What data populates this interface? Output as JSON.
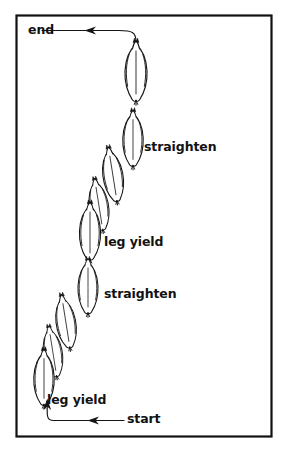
{
  "diagram": {
    "type": "arena-schooling-figure",
    "frame": {
      "border_color": "#111111",
      "background_color": "#ffffff",
      "x": 16,
      "y": 15,
      "width": 256,
      "height": 422
    },
    "labels": {
      "end": "end",
      "start": "start",
      "straighten_upper": "straighten",
      "leg_yield_upper": "leg yield",
      "straighten_lower": "straighten",
      "leg_yield_lower": "leg yield"
    },
    "label_positions": [
      {
        "name": "end-label",
        "text": "end",
        "x": 28,
        "y": 24
      },
      {
        "name": "straighten-upper-label",
        "text": "straighten",
        "x": 144,
        "y": 141
      },
      {
        "name": "leg-yield-upper-label",
        "text": "leg yield",
        "x": 104,
        "y": 236
      },
      {
        "name": "straighten-lower-label",
        "text": "straighten",
        "x": 104,
        "y": 288
      },
      {
        "name": "leg-yield-lower-label",
        "text": "leg yield",
        "x": 47,
        "y": 394
      },
      {
        "name": "start-label",
        "text": "start",
        "x": 127,
        "y": 417
      }
    ],
    "horses": [
      {
        "index": 1,
        "cx": 136,
        "cy": 73,
        "w": 24,
        "h": 56,
        "tilt": 0
      },
      {
        "index": 2,
        "cx": 133,
        "cy": 140,
        "w": 22,
        "h": 52,
        "tilt": 0
      },
      {
        "index": 3,
        "cx": 113,
        "cy": 175,
        "w": 22,
        "h": 52,
        "tilt": -8
      },
      {
        "index": 4,
        "cx": 100,
        "cy": 205,
        "w": 20,
        "h": 48,
        "tilt": -8
      },
      {
        "index": 5,
        "cx": 90,
        "cy": 232,
        "w": 22,
        "h": 54,
        "tilt": 0
      },
      {
        "index": 6,
        "cx": 88,
        "cy": 287,
        "w": 22,
        "h": 52,
        "tilt": 0
      },
      {
        "index": 7,
        "cx": 66,
        "cy": 322,
        "w": 21,
        "h": 50,
        "tilt": -8
      },
      {
        "index": 8,
        "cx": 54,
        "cy": 352,
        "w": 20,
        "h": 48,
        "tilt": -8
      },
      {
        "index": 9,
        "cx": 44,
        "cy": 378,
        "w": 21,
        "h": 52,
        "tilt": 0
      }
    ],
    "arrows": {
      "end_arrow": {
        "name": "end-arrow",
        "description": "leaves top horse, curves left and exits toward end label",
        "path": "M 136 46 C 136 33 133 31 118 31 L 40 31",
        "arrowhead_at": {
          "x": 84,
          "y": 31
        },
        "direction": "left"
      },
      "start_arrow": {
        "name": "start-arrow",
        "description": "enters from start label, runs left then curves up to bottom horse",
        "path": "M 124 420 L 55 420 C 48 420 47 418 47 411 L 47 400",
        "arrowheads_at": [
          {
            "x": 88,
            "y": 420
          },
          {
            "x": 47,
            "y": 401
          }
        ],
        "direction": "left-then-up"
      }
    },
    "colors": {
      "ink": "#111111",
      "line": "#1a1a1a",
      "paper": "#ffffff"
    }
  }
}
